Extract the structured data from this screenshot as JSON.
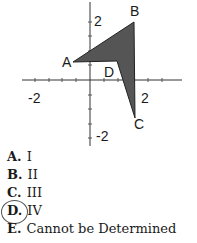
{
  "figure": {
    "points": {
      "A": {
        "label": "A"
      },
      "B": {
        "label": "B"
      },
      "C": {
        "label": "C"
      },
      "D": {
        "label": "D"
      }
    },
    "axis_ticks": {
      "x_neg": "-2",
      "x_pos": "2",
      "y_pos": "2",
      "y_neg": "-2"
    },
    "fill_color": "#555555"
  },
  "choices": [
    {
      "key": "A.",
      "text": "I"
    },
    {
      "key": "B.",
      "text": "II"
    },
    {
      "key": "C.",
      "text": "III"
    },
    {
      "key": "D.",
      "text": "IV",
      "circled": true
    },
    {
      "key": "E.",
      "text": "Cannot be Determined"
    }
  ]
}
